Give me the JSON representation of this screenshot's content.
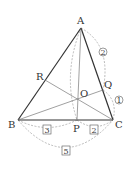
{
  "points": {
    "A": {
      "label": "A",
      "x": 81,
      "y": 28
    },
    "B": {
      "label": "B",
      "x": 18,
      "y": 120
    },
    "C": {
      "label": "C",
      "x": 113,
      "y": 120
    },
    "P": {
      "label": "P",
      "x": 77,
      "y": 120
    },
    "O": {
      "label": "O",
      "x": 77,
      "y": 99
    },
    "Q": {
      "label": "Q",
      "x": 103,
      "y": 90
    },
    "R": {
      "label": "R",
      "x": 45,
      "y": 80
    }
  },
  "ratios": {
    "AQ": "2",
    "QC": "1",
    "BP": "3",
    "PC": "2",
    "BC": "5"
  },
  "colors": {
    "line": "#333333",
    "thin": "#777777",
    "dashed": "#aaaaaa"
  }
}
